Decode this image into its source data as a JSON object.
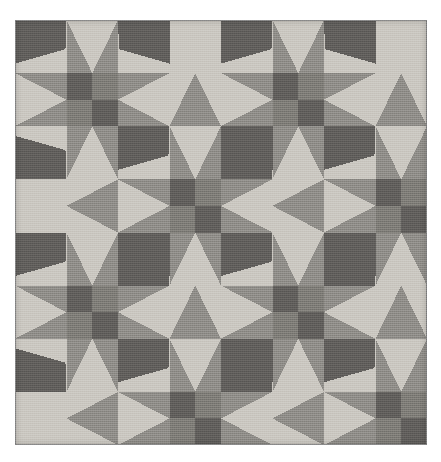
{
  "artwork": {
    "title": "Geometric Patchwork Quilt",
    "kind": "quilt-pattern",
    "alt_text": "Grayscale geometric quilt: repeating eight-pointed star blocks alternating with pinwheel blocks",
    "canvas": {
      "width": 441,
      "height": 462,
      "background": "#ffffff"
    },
    "quilt": {
      "x": 15,
      "y": 20,
      "width": 412,
      "height": 425,
      "grid_columns": 8,
      "grid_rows": 8,
      "cell_width": 51.5,
      "cell_height": 53.125,
      "block_repeat": "star-and-pinwheel",
      "border_color": "#8d8d8d"
    },
    "palette": {
      "light": "#c9c6bf",
      "light_alt": "#c2bfb8",
      "medium": "#8d8b86",
      "medium_dark": "#7c7a75",
      "dark": "#5f5d5a",
      "darkest": "#565451",
      "background": "#ffffff"
    },
    "motifs": [
      {
        "name": "eight-point-star",
        "count": 16,
        "description": "Star with four light points and four dark corner kites around a four-patch center"
      },
      {
        "name": "four-patch-center",
        "count": 16,
        "description": "Two dark and two medium squares in a checker arrangement"
      },
      {
        "name": "pinwheel-x",
        "count": 16,
        "description": "Four dark triangles meeting at the block center forming an X"
      },
      {
        "name": "horizontal-diamond",
        "count": 16,
        "description": "Medium-gray elongated diamond between star blocks"
      },
      {
        "name": "vertical-diamond",
        "count": 16,
        "description": "Medium-gray elongated diamond stacked between star blocks"
      }
    ]
  }
}
